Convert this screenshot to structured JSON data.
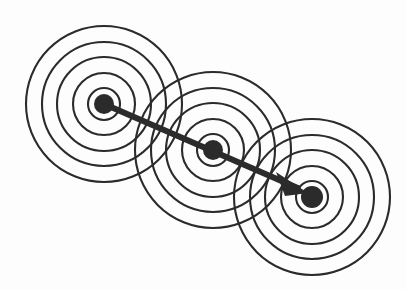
{
  "figure": {
    "background_color": "#fdfdfd",
    "stroke_color": "#2b2b2b",
    "width": 406,
    "height": 290
  },
  "chart_data": {
    "type": "diagram",
    "xlabel": "",
    "ylabel": "",
    "legend": [],
    "annotations": [],
    "grid": false,
    "ring_count_per_node": 5,
    "ring_radii": [
      16,
      31,
      47,
      62,
      78
    ],
    "ring_stroke_width": 2.1,
    "node_dot_radius": 9.5,
    "nodes": [
      {
        "id": "node-1",
        "label": "",
        "cx": 104,
        "cy": 104,
        "dot_radius": 10
      },
      {
        "id": "node-2",
        "label": "",
        "cx": 213,
        "cy": 150,
        "dot_radius": 10
      },
      {
        "id": "node-3",
        "label": "",
        "cx": 312,
        "cy": 197,
        "dot_radius": 11
      }
    ],
    "arrow": {
      "from_node": "node-1",
      "to_node": "node-3",
      "x1": 104,
      "y1": 104,
      "x2": 306,
      "y2": 192,
      "shaft_width": 6.2,
      "head": {
        "tip_x": 306,
        "tip_y": 192,
        "back_left_x": 276,
        "back_left_y": 172,
        "back_right_x": 285,
        "back_right_y": 196
      }
    }
  },
  "icons": {
    "node": "filled-circle-icon",
    "wave": "concentric-rings-icon",
    "direction": "arrow-icon"
  }
}
